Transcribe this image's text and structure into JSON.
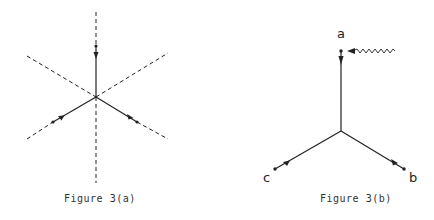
{
  "figures": [
    {
      "id": "3a",
      "caption": "Figure 3(a)",
      "description": "Six-fold star of dashed lines with three solid arrowed segments converging at center"
    },
    {
      "id": "3b",
      "caption": "Figure 3(b)",
      "vertex_labels": {
        "a": "a",
        "b": "b",
        "c": "c"
      },
      "description": "Three-legged vertex with incoming wavy line at leg a"
    }
  ],
  "colors": {
    "line": "#222222",
    "background": "#ffffff"
  }
}
